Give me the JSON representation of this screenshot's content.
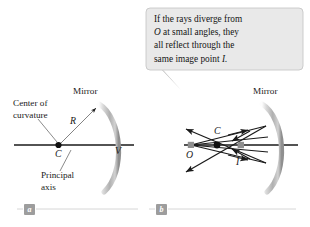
{
  "figure": {
    "background_color": "#ffffff",
    "ink_color": "#1a1a1a",
    "mirror_color": "#b5b5b5",
    "marker_gray": "#8f8f8f"
  },
  "callout": {
    "line1": "If the rays diverge from",
    "line2_pre": "O",
    "line2_post": " at small angles, they",
    "line3": "all reflect through the",
    "line4_pre": "same image point ",
    "line4_post": "I.",
    "background_color": "#e9e9e9",
    "border_color": "#c2c2c2"
  },
  "panel_a": {
    "tag": "a",
    "labels": {
      "center_of_curvature_line1": "Center of",
      "center_of_curvature_line2": "curvature",
      "mirror": "Mirror",
      "radius": "R",
      "center_point": "C",
      "vertex_point": "V",
      "principal_axis_line1": "Principal",
      "principal_axis_line2": "axis"
    }
  },
  "panel_b": {
    "tag": "b",
    "labels": {
      "mirror": "Mirror",
      "object_point": "O",
      "center_point": "C",
      "image_point": "I"
    }
  }
}
